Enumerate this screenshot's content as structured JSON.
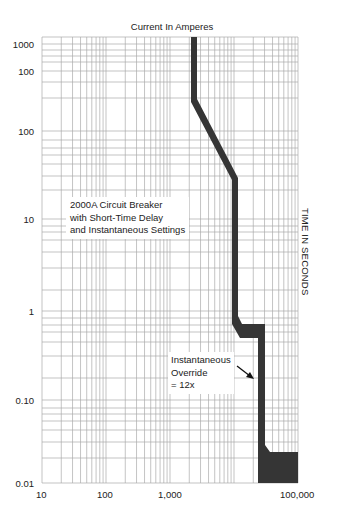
{
  "chart_data": {
    "type": "line",
    "title": "Current In Amperes",
    "xlabel": "Current In Amperes",
    "ylabel": "TIME IN SECONDS",
    "x_scale": "log",
    "y_scale": "log",
    "x_tick_labels": [
      "10",
      "100",
      "1,000",
      "100,000"
    ],
    "y_tick_labels": [
      "1000",
      "100",
      "100",
      "10",
      "1",
      "0.10",
      "0.01"
    ],
    "xlim": [
      10,
      100000
    ],
    "ylim": [
      0.01,
      1000
    ],
    "grid": true,
    "legend": null,
    "annotations": [
      {
        "text": "2000A Circuit Breaker\nwith Short-Time Delay\nand Instantaneous Settings"
      },
      {
        "text": "Instantaneous\nOverride\n= 12x",
        "arrow": true
      }
    ],
    "series": [
      {
        "name": "2000A breaker trip band (min edge)",
        "points_current_amps": [
          1800,
          1800,
          5000,
          5000,
          6000,
          24000,
          24000,
          100000
        ],
        "points_time_s": [
          1000,
          100,
          30,
          0.7,
          0.55,
          0.55,
          0.02,
          0.02
        ]
      },
      {
        "name": "2000A breaker trip band (max edge)",
        "points_current_amps": [
          2200,
          2200,
          6000,
          6000,
          7000,
          30000,
          30000,
          100000
        ],
        "points_time_s": [
          1000,
          100,
          30,
          0.8,
          0.6,
          0.6,
          0.025,
          0.025
        ]
      }
    ]
  },
  "header": {
    "title": "Current In Amperes"
  },
  "axes": {
    "y_ticks": [
      {
        "label": "1000",
        "top": 39
      },
      {
        "label": "100",
        "top": 66
      },
      {
        "label": "100",
        "top": 126
      },
      {
        "label": "10",
        "top": 214
      },
      {
        "label": "1",
        "top": 306
      },
      {
        "label": "0.10",
        "top": 395
      },
      {
        "label": "0.01",
        "top": 478
      }
    ],
    "x_ticks": [
      {
        "label": "10",
        "left": 36
      },
      {
        "label": "100",
        "left": 97
      },
      {
        "label": "1,000",
        "left": 158
      },
      {
        "label": "100,000",
        "left": 280
      }
    ],
    "right_label": "TIME IN SECONDS"
  },
  "annotations": {
    "breaker_line1": "2000A Circuit Breaker",
    "breaker_line2": "with Short-Time Delay",
    "breaker_line3": "and Instantaneous Settings",
    "override_line1": "Instantaneous",
    "override_line2": "Override",
    "override_line3": "= 12x"
  },
  "colors": {
    "band": "#333333",
    "grid": "#a8a8a8",
    "text": "#222222"
  }
}
